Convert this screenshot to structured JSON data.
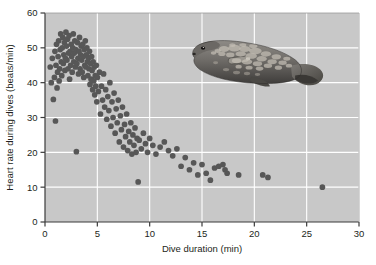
{
  "chart_data": {
    "type": "scatter",
    "title": "",
    "xlabel": "Dive duration (min)",
    "ylabel": "Heart rate during dives (beats/min)",
    "xlim": [
      0,
      30
    ],
    "ylim": [
      0,
      60
    ],
    "xticks": [
      0,
      5,
      10,
      15,
      20,
      25,
      30
    ],
    "yticks": [
      0,
      10,
      20,
      30,
      40,
      50,
      60
    ],
    "grid": true,
    "legend": null,
    "plot_background_color": "#c8c8c8",
    "gridline_color": "#ffffff",
    "point_color": "#575757",
    "series": [
      {
        "name": "Dives",
        "points": [
          [
            0.5,
            44.5
          ],
          [
            0.6,
            40.0
          ],
          [
            0.7,
            47.0
          ],
          [
            0.8,
            35.2
          ],
          [
            0.9,
            41.5
          ],
          [
            0.95,
            49.0
          ],
          [
            1.0,
            29.0
          ],
          [
            1.05,
            45.0
          ],
          [
            1.1,
            51.0
          ],
          [
            1.15,
            38.5
          ],
          [
            1.2,
            43.0
          ],
          [
            1.25,
            47.5
          ],
          [
            1.3,
            52.0
          ],
          [
            1.35,
            40.5
          ],
          [
            1.4,
            44.0
          ],
          [
            1.45,
            49.5
          ],
          [
            1.5,
            54.0
          ],
          [
            1.55,
            46.0
          ],
          [
            1.6,
            42.0
          ],
          [
            1.65,
            50.0
          ],
          [
            1.7,
            53.0
          ],
          [
            1.75,
            45.5
          ],
          [
            1.8,
            48.0
          ],
          [
            1.85,
            51.5
          ],
          [
            1.9,
            43.5
          ],
          [
            1.95,
            47.0
          ],
          [
            2.0,
            54.5
          ],
          [
            2.05,
            50.5
          ],
          [
            2.1,
            46.5
          ],
          [
            2.15,
            52.5
          ],
          [
            2.2,
            44.0
          ],
          [
            2.25,
            48.5
          ],
          [
            2.3,
            53.5
          ],
          [
            2.35,
            41.0
          ],
          [
            2.4,
            49.0
          ],
          [
            2.45,
            45.0
          ],
          [
            2.5,
            51.0
          ],
          [
            2.55,
            47.5
          ],
          [
            2.6,
            43.0
          ],
          [
            2.65,
            50.0
          ],
          [
            2.7,
            54.0
          ],
          [
            2.75,
            46.0
          ],
          [
            2.8,
            48.5
          ],
          [
            2.85,
            52.0
          ],
          [
            2.9,
            44.5
          ],
          [
            2.95,
            49.5
          ],
          [
            3.0,
            20.2
          ],
          [
            3.05,
            45.5
          ],
          [
            3.1,
            51.5
          ],
          [
            3.15,
            47.0
          ],
          [
            3.2,
            42.5
          ],
          [
            3.25,
            49.0
          ],
          [
            3.3,
            53.0
          ],
          [
            3.35,
            44.0
          ],
          [
            3.4,
            48.0
          ],
          [
            3.45,
            50.5
          ],
          [
            3.5,
            46.5
          ],
          [
            3.55,
            43.0
          ],
          [
            3.6,
            51.0
          ],
          [
            3.65,
            47.5
          ],
          [
            3.7,
            41.5
          ],
          [
            3.75,
            49.5
          ],
          [
            3.8,
            45.0
          ],
          [
            3.85,
            52.0
          ],
          [
            3.9,
            44.5
          ],
          [
            3.95,
            48.0
          ],
          [
            4.0,
            50.0
          ],
          [
            4.05,
            46.0
          ],
          [
            4.1,
            42.0
          ],
          [
            4.15,
            47.0
          ],
          [
            4.2,
            44.0
          ],
          [
            4.25,
            49.0
          ],
          [
            4.3,
            39.5
          ],
          [
            4.35,
            45.5
          ],
          [
            4.4,
            41.0
          ],
          [
            4.45,
            47.5
          ],
          [
            4.5,
            43.5
          ],
          [
            4.55,
            38.0
          ],
          [
            4.6,
            46.0
          ],
          [
            4.65,
            40.5
          ],
          [
            4.7,
            44.5
          ],
          [
            4.75,
            36.5
          ],
          [
            4.8,
            42.0
          ],
          [
            4.85,
            39.0
          ],
          [
            4.9,
            45.0
          ],
          [
            4.95,
            34.5
          ],
          [
            5.0,
            41.5
          ],
          [
            5.1,
            37.5
          ],
          [
            5.2,
            43.0
          ],
          [
            5.3,
            31.0
          ],
          [
            5.4,
            39.0
          ],
          [
            5.5,
            35.0
          ],
          [
            5.6,
            42.5
          ],
          [
            5.7,
            33.0
          ],
          [
            5.8,
            38.0
          ],
          [
            5.9,
            29.5
          ],
          [
            6.0,
            36.0
          ],
          [
            6.1,
            32.0
          ],
          [
            6.2,
            40.0
          ],
          [
            6.3,
            27.5
          ],
          [
            6.4,
            34.5
          ],
          [
            6.5,
            30.0
          ],
          [
            6.6,
            37.0
          ],
          [
            6.7,
            25.5
          ],
          [
            6.8,
            32.5
          ],
          [
            6.9,
            28.5
          ],
          [
            7.0,
            35.0
          ],
          [
            7.1,
            23.0
          ],
          [
            7.2,
            30.5
          ],
          [
            7.3,
            26.5
          ],
          [
            7.4,
            33.0
          ],
          [
            7.5,
            21.5
          ],
          [
            7.6,
            28.0
          ],
          [
            7.7,
            24.5
          ],
          [
            7.8,
            31.0
          ],
          [
            7.9,
            20.5
          ],
          [
            8.0,
            26.0
          ],
          [
            8.1,
            23.0
          ],
          [
            8.2,
            28.5
          ],
          [
            8.3,
            19.5
          ],
          [
            8.4,
            25.0
          ],
          [
            8.5,
            22.0
          ],
          [
            8.6,
            27.0
          ],
          [
            8.7,
            20.0
          ],
          [
            8.8,
            24.0
          ],
          [
            8.9,
            11.5
          ],
          [
            9.0,
            23.5
          ],
          [
            9.2,
            21.0
          ],
          [
            9.4,
            25.5
          ],
          [
            9.6,
            22.5
          ],
          [
            9.8,
            20.0
          ],
          [
            10.0,
            24.0
          ],
          [
            10.3,
            22.0
          ],
          [
            10.6,
            19.5
          ],
          [
            11.0,
            21.5
          ],
          [
            11.4,
            23.0
          ],
          [
            11.8,
            20.5
          ],
          [
            12.2,
            19.0
          ],
          [
            12.6,
            21.0
          ],
          [
            13.0,
            16.0
          ],
          [
            13.4,
            18.5
          ],
          [
            13.8,
            15.0
          ],
          [
            14.2,
            17.0
          ],
          [
            14.6,
            13.5
          ],
          [
            15.0,
            16.5
          ],
          [
            15.4,
            14.0
          ],
          [
            15.8,
            12.0
          ],
          [
            16.2,
            15.5
          ],
          [
            16.6,
            16.0
          ],
          [
            17.0,
            16.5
          ],
          [
            17.2,
            15.0
          ],
          [
            17.4,
            14.0
          ],
          [
            18.5,
            13.5
          ],
          [
            20.8,
            13.5
          ],
          [
            21.3,
            12.8
          ],
          [
            26.5,
            10.0
          ]
        ]
      }
    ],
    "annotations": [
      {
        "type": "image",
        "name": "grey-seal-with-data-logger",
        "description": "Photograph of a grey seal swimming, facing left, with a cylindrical data-logger tag attached to its back",
        "x_range": [
          13.5,
          25.5
        ],
        "y_range": [
          37,
          55
        ]
      }
    ]
  },
  "tick_labels": {
    "x": [
      "0",
      "5",
      "10",
      "15",
      "20",
      "25",
      "30"
    ],
    "y": [
      "0",
      "10",
      "20",
      "30",
      "40",
      "50",
      "60"
    ]
  },
  "axis_titles": {
    "x": "Dive duration (min)",
    "y": "Heart rate during dives (beats/min)"
  }
}
